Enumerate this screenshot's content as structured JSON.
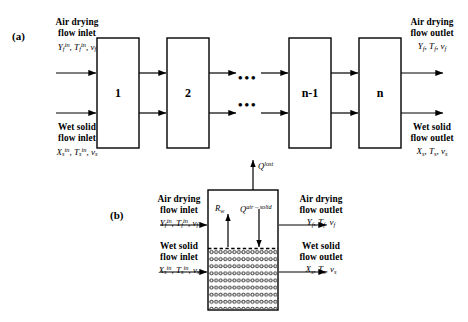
{
  "figure": {
    "panel_a": {
      "tag": "(a)",
      "inlet_air": {
        "title_line1": "Air drying",
        "title_line2": "flow inlet",
        "vars": "Yfin, Tfin, vf"
      },
      "inlet_solid": {
        "title_line1": "Wet solid",
        "title_line2": "flow inlet",
        "vars": "Xsin, Tsin, vs"
      },
      "outlet_air": {
        "title_line1": "Air drying",
        "title_line2": "flow outlet",
        "vars": "Yf, Tf, vf"
      },
      "outlet_solid": {
        "title_line1": "Wet solid",
        "title_line2": "flow outlet",
        "vars": "Xs, Ts, vs"
      },
      "stages": [
        "1",
        "2",
        "n-1",
        "n"
      ],
      "ellipsis_top": "•••",
      "ellipsis_bottom": "•••"
    },
    "panel_b": {
      "tag": "(b)",
      "inlet_air": {
        "title_line1": "Air drying",
        "title_line2": "flow inlet",
        "vars": "Yfin, Tfin, vf"
      },
      "inlet_solid": {
        "title_line1": "Wet solid",
        "title_line2": "flow inlet",
        "vars": "Xsin, Tsin, vs"
      },
      "outlet_air": {
        "title_line1": "Air drying",
        "title_line2": "flow outlet",
        "vars": "Yf, Tf, vf"
      },
      "outlet_solid": {
        "title_line1": "Wet solid",
        "title_line2": "flow outlet",
        "vars": "Xs, Ts, vs"
      },
      "flux_lost": "Qlost",
      "flux_rw": "Rw",
      "flux_air_solid": "Qair→solid",
      "bed_particle_cols": 15,
      "bed_particle_rows": 9
    }
  },
  "colors": {
    "line": "#000000",
    "background": "#ffffff",
    "text": "#000000"
  }
}
